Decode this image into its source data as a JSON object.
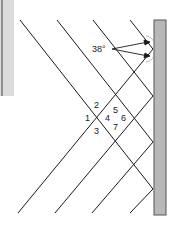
{
  "diagram": {
    "angle_label": "38°",
    "angle_labels": [
      "1",
      "2",
      "3",
      "4",
      "5",
      "6",
      "7"
    ],
    "colors": {
      "line": "#1a1a1a",
      "wall_fill": "#b8b8b8",
      "wall_stroke": "#555555",
      "strip": "#d8d8d8"
    }
  }
}
